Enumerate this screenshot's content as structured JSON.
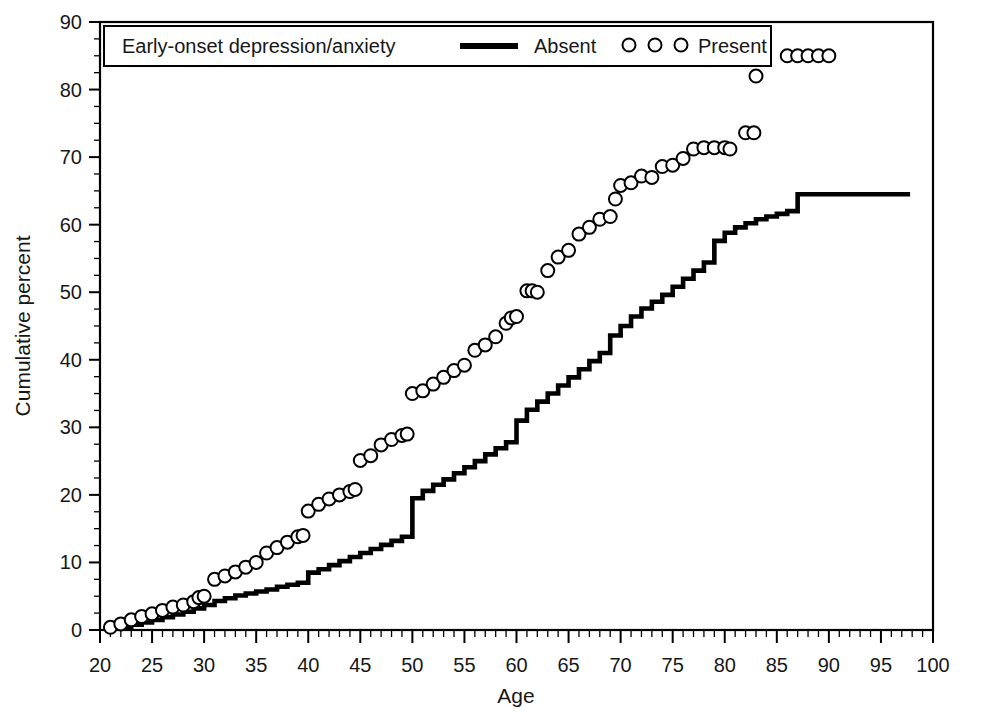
{
  "chart_data": {
    "type": "line",
    "title": "",
    "xlabel": "Age",
    "ylabel": "Cumulative percent",
    "xlim": [
      20,
      100
    ],
    "ylim": [
      0,
      90
    ],
    "xticks": [
      20,
      25,
      30,
      35,
      40,
      45,
      50,
      55,
      60,
      65,
      70,
      75,
      80,
      85,
      90,
      95,
      100
    ],
    "yticks": [
      0,
      10,
      20,
      30,
      40,
      50,
      60,
      70,
      80,
      90
    ],
    "xtick_minor_step": 1,
    "ytick_minor_step": 2.5,
    "grid": false,
    "legend_position": "top",
    "legend_title": "Early-onset depression/anxiety",
    "series": [
      {
        "name": "Absent",
        "style": "step-line",
        "marker": "none",
        "color": "#000000",
        "points": [
          [
            21,
            0.3
          ],
          [
            22,
            0.5
          ],
          [
            23,
            0.8
          ],
          [
            24,
            1.1
          ],
          [
            25,
            1.5
          ],
          [
            26,
            1.9
          ],
          [
            27,
            2.3
          ],
          [
            28,
            2.7
          ],
          [
            29,
            3.2
          ],
          [
            30,
            3.7
          ],
          [
            31,
            4.3
          ],
          [
            32,
            4.7
          ],
          [
            33,
            5.1
          ],
          [
            34,
            5.4
          ],
          [
            35,
            5.7
          ],
          [
            36,
            6.0
          ],
          [
            37,
            6.4
          ],
          [
            38,
            6.7
          ],
          [
            39,
            7.0
          ],
          [
            40,
            8.5
          ],
          [
            41,
            9.0
          ],
          [
            42,
            9.6
          ],
          [
            43,
            10.2
          ],
          [
            44,
            10.8
          ],
          [
            45,
            11.4
          ],
          [
            46,
            12.0
          ],
          [
            47,
            12.6
          ],
          [
            48,
            13.2
          ],
          [
            49,
            13.8
          ],
          [
            50,
            19.5
          ],
          [
            51,
            20.6
          ],
          [
            52,
            21.5
          ],
          [
            53,
            22.3
          ],
          [
            54,
            23.2
          ],
          [
            55,
            24.1
          ],
          [
            56,
            25.0
          ],
          [
            57,
            26.0
          ],
          [
            58,
            26.9
          ],
          [
            59,
            27.8
          ],
          [
            60,
            31.0
          ],
          [
            61,
            32.6
          ],
          [
            62,
            33.8
          ],
          [
            63,
            35.0
          ],
          [
            64,
            36.2
          ],
          [
            65,
            37.4
          ],
          [
            66,
            38.6
          ],
          [
            67,
            39.8
          ],
          [
            68,
            41.0
          ],
          [
            69,
            43.6
          ],
          [
            70,
            45.0
          ],
          [
            71,
            46.4
          ],
          [
            72,
            47.6
          ],
          [
            73,
            48.6
          ],
          [
            74,
            49.6
          ],
          [
            75,
            50.8
          ],
          [
            76,
            52.0
          ],
          [
            77,
            53.2
          ],
          [
            78,
            54.4
          ],
          [
            79,
            57.6
          ],
          [
            80,
            58.8
          ],
          [
            81,
            59.6
          ],
          [
            82,
            60.2
          ],
          [
            83,
            60.8
          ],
          [
            84,
            61.2
          ],
          [
            85,
            61.6
          ],
          [
            86,
            62.0
          ],
          [
            87,
            64.5
          ],
          [
            97.8,
            64.5
          ]
        ]
      },
      {
        "name": "Present",
        "style": "markers",
        "marker": "open-circle",
        "color": "#000000",
        "points": [
          [
            21,
            0.4
          ],
          [
            22,
            0.9
          ],
          [
            23,
            1.5
          ],
          [
            24,
            2.0
          ],
          [
            25,
            2.4
          ],
          [
            26,
            2.9
          ],
          [
            27,
            3.4
          ],
          [
            28,
            3.7
          ],
          [
            29,
            4.2
          ],
          [
            29.5,
            4.8
          ],
          [
            30,
            5.0
          ],
          [
            31,
            7.5
          ],
          [
            32,
            8.0
          ],
          [
            33,
            8.6
          ],
          [
            34,
            9.3
          ],
          [
            35,
            10.0
          ],
          [
            36,
            11.4
          ],
          [
            37,
            12.2
          ],
          [
            38,
            13.0
          ],
          [
            39,
            13.8
          ],
          [
            39.5,
            14.0
          ],
          [
            40,
            17.6
          ],
          [
            41,
            18.6
          ],
          [
            42,
            19.4
          ],
          [
            43,
            20.0
          ],
          [
            44,
            20.5
          ],
          [
            44.5,
            20.8
          ],
          [
            45,
            25.1
          ],
          [
            46,
            25.8
          ],
          [
            47,
            27.4
          ],
          [
            48,
            28.2
          ],
          [
            49,
            28.8
          ],
          [
            49.5,
            29.0
          ],
          [
            50,
            35.0
          ],
          [
            51,
            35.4
          ],
          [
            52,
            36.4
          ],
          [
            53,
            37.4
          ],
          [
            54,
            38.4
          ],
          [
            55,
            39.2
          ],
          [
            56,
            41.4
          ],
          [
            57,
            42.2
          ],
          [
            58,
            43.4
          ],
          [
            59,
            45.4
          ],
          [
            59.5,
            46.2
          ],
          [
            60,
            46.4
          ],
          [
            61,
            50.2
          ],
          [
            61.5,
            50.2
          ],
          [
            62,
            50.0
          ],
          [
            63,
            53.2
          ],
          [
            64,
            55.2
          ],
          [
            65,
            56.2
          ],
          [
            66,
            58.6
          ],
          [
            67,
            59.6
          ],
          [
            68,
            60.8
          ],
          [
            69,
            61.2
          ],
          [
            69.5,
            63.8
          ],
          [
            70,
            65.8
          ],
          [
            71,
            66.2
          ],
          [
            72,
            67.2
          ],
          [
            73,
            67.0
          ],
          [
            74,
            68.6
          ],
          [
            75,
            68.8
          ],
          [
            76,
            69.8
          ],
          [
            77,
            71.2
          ],
          [
            78,
            71.4
          ],
          [
            79,
            71.4
          ],
          [
            80,
            71.4
          ],
          [
            80.5,
            71.2
          ],
          [
            82,
            73.6
          ],
          [
            82.8,
            73.6
          ],
          [
            83,
            82.0
          ],
          [
            86,
            85.0
          ],
          [
            87,
            85.0
          ],
          [
            88,
            85.0
          ],
          [
            89,
            85.0
          ],
          [
            90,
            85.0
          ]
        ]
      }
    ]
  },
  "legend": {
    "title": "Early-onset depression/anxiety",
    "entries": [
      {
        "label": "Absent",
        "glyph": "solid-line"
      },
      {
        "label": "Present",
        "glyph": "open-circles"
      }
    ]
  },
  "axes": {
    "x_title": "Age",
    "y_title": "Cumulative percent",
    "x_labels": [
      "20",
      "25",
      "30",
      "35",
      "40",
      "45",
      "50",
      "55",
      "60",
      "65",
      "70",
      "75",
      "80",
      "85",
      "90",
      "95",
      "100"
    ],
    "y_labels": [
      "0",
      "10",
      "20",
      "30",
      "40",
      "50",
      "60",
      "70",
      "80",
      "90"
    ]
  },
  "colors": {
    "foreground": "#000000",
    "background": "#ffffff",
    "marker_fill": "#ffffff"
  }
}
